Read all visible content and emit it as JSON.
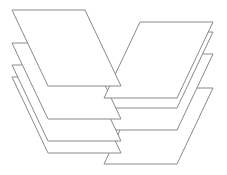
{
  "figure": {
    "stroke_color": "#8a8a8a",
    "fill_color": "#ffffff",
    "sheets": [
      {
        "id": "right-4",
        "stack": "right",
        "points": "104,164 177,164 213,88 140,88"
      },
      {
        "id": "left-4",
        "stack": "left",
        "points": "12,77 85,77 121,153 48,153"
      },
      {
        "id": "right-3",
        "stack": "right",
        "points": "104,130 177,130 213,54 140,54"
      },
      {
        "id": "left-3",
        "stack": "left",
        "points": "12,65 85,65 121,141 48,141"
      },
      {
        "id": "right-2",
        "stack": "right",
        "points": "104,108 177,108 213,32 140,32"
      },
      {
        "id": "left-2",
        "stack": "left",
        "points": "12,43 85,43 121,119 48,119"
      },
      {
        "id": "right-1",
        "stack": "right",
        "points": "104,98 177,98 213,22 140,22"
      },
      {
        "id": "left-1",
        "stack": "left",
        "points": "12,10 85,10 121,86 48,86"
      }
    ]
  }
}
